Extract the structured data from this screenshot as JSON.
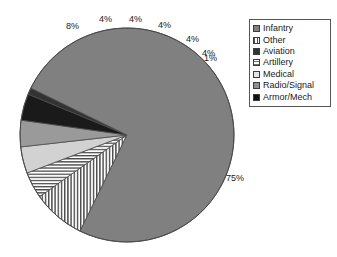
{
  "chart_data": {
    "type": "pie",
    "title": "",
    "subtitle": "",
    "xlabel": "",
    "ylabel": "",
    "grid": false,
    "legend_position": "right",
    "categories": [
      "Infantry",
      "Other",
      "Aviation",
      "Artillery",
      "Medical",
      "Radio/Signal",
      "Armor/Mech"
    ],
    "values": [
      75,
      8,
      1,
      4,
      4,
      4,
      4
    ],
    "value_labels": [
      "75%",
      "8%",
      "1%",
      "4%",
      "4%",
      "4%",
      "4%"
    ],
    "units": "percent",
    "slices": [
      {
        "label": "Infantry",
        "value": 75,
        "value_label": "75%",
        "fill": "#808080",
        "pattern": "solid",
        "swatch_fill": "#808080"
      },
      {
        "label": "Other",
        "value": 8,
        "value_label": "8%",
        "fill": "#ffffff",
        "pattern": "vertical",
        "swatch_fill": "#ffffff"
      },
      {
        "label": "Aviation",
        "value": 1,
        "value_label": "1%",
        "fill": "#333333",
        "pattern": "solid",
        "swatch_fill": "#333333"
      },
      {
        "label": "Artillery",
        "value": 4,
        "value_label": "4%",
        "fill": "#ffffff",
        "pattern": "horizontal",
        "swatch_fill": "#ffffff"
      },
      {
        "label": "Medical",
        "value": 4,
        "value_label": "4%",
        "fill": "#d2d2d2",
        "pattern": "solid",
        "swatch_fill": "#e4e4e4"
      },
      {
        "label": "Radio/Signal",
        "value": 4,
        "value_label": "4%",
        "fill": "#9a9a9a",
        "pattern": "solid",
        "swatch_fill": "#909090"
      },
      {
        "label": "Armor/Mech",
        "value": 4,
        "value_label": "4%",
        "fill": "#1a1a1a",
        "pattern": "solid",
        "swatch_fill": "#111111"
      }
    ],
    "callouts": [
      {
        "text": "8%",
        "for": "Other"
      },
      {
        "text": "4%",
        "for": "Artillery"
      },
      {
        "text": "4%",
        "for": "Medical"
      },
      {
        "text": "4%",
        "for": "Radio/Signal"
      },
      {
        "text": "4%",
        "for": "Armor/Mech"
      },
      {
        "text": "4%",
        "for": "Aviation-upper"
      },
      {
        "text": "1%",
        "for": "Aviation"
      },
      {
        "text": "75%",
        "for": "Infantry"
      }
    ]
  },
  "legend": {
    "items": [
      {
        "label": "Infantry"
      },
      {
        "label": "Other"
      },
      {
        "label": "Aviation"
      },
      {
        "label": "Artillery"
      },
      {
        "label": "Medical"
      },
      {
        "label": "Radio/Signal"
      },
      {
        "label": "Armor/Mech"
      }
    ]
  },
  "colors": {
    "background": "#ffffff",
    "text": "#1a1a1a",
    "outline": "#3c3c3c",
    "legend_border": "#555555"
  }
}
